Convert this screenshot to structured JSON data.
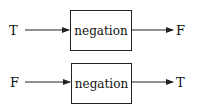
{
  "rows": [
    {
      "input": "T",
      "operation": "negation",
      "output": "F"
    },
    {
      "input": "F",
      "operation": "negation",
      "output": "T"
    }
  ]
}
